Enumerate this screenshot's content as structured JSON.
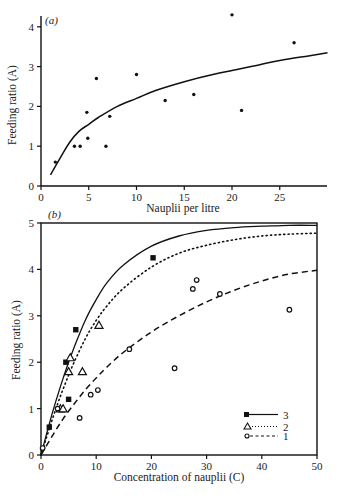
{
  "chart_data": [
    {
      "panel": "(a)",
      "type": "scatter",
      "title": "",
      "xlabel": "Nauplii per litre",
      "ylabel": "Feeding ratio (A)",
      "xlim": [
        0,
        30
      ],
      "ylim": [
        0,
        4
      ],
      "xticks": [
        0,
        5,
        10,
        15,
        20,
        25
      ],
      "yticks": [
        0,
        1,
        2,
        3,
        4
      ],
      "grid": false,
      "series": [
        {
          "name": "observations",
          "marker": "dot",
          "points": [
            [
              1.5,
              0.6
            ],
            [
              3.5,
              1.0
            ],
            [
              4.1,
              1.0
            ],
            [
              4.8,
              1.85
            ],
            [
              4.9,
              1.2
            ],
            [
              5.8,
              2.7
            ],
            [
              6.8,
              1.0
            ],
            [
              7.2,
              1.75
            ],
            [
              10.0,
              2.8
            ],
            [
              13.0,
              2.15
            ],
            [
              16.0,
              2.3
            ],
            [
              20.0,
              4.3
            ],
            [
              21.0,
              1.9
            ],
            [
              26.5,
              3.6
            ]
          ]
        },
        {
          "name": "fitted curve",
          "line": "solid",
          "points": [
            [
              1.0,
              0.28
            ],
            [
              2.0,
              0.7
            ],
            [
              3.0,
              1.1
            ],
            [
              4.0,
              1.38
            ],
            [
              5.0,
              1.55
            ],
            [
              6.0,
              1.72
            ],
            [
              8.0,
              2.0
            ],
            [
              10.0,
              2.2
            ],
            [
              12.0,
              2.4
            ],
            [
              15.0,
              2.62
            ],
            [
              18.0,
              2.8
            ],
            [
              20.0,
              2.9
            ],
            [
              22.0,
              3.0
            ],
            [
              25.0,
              3.15
            ],
            [
              28.0,
              3.27
            ],
            [
              30.0,
              3.35
            ]
          ]
        }
      ]
    },
    {
      "panel": "(b)",
      "type": "scatter",
      "title": "",
      "xlabel": "Concentration of nauplii (C)",
      "ylabel": "Feeding ratio (A)",
      "xlim": [
        0,
        50
      ],
      "ylim": [
        0,
        5
      ],
      "xticks": [
        0,
        10,
        20,
        30,
        40,
        50
      ],
      "yticks": [
        0,
        1,
        2,
        3,
        4,
        5
      ],
      "grid": false,
      "legend_position": "lower right",
      "series": [
        {
          "name": "3",
          "marker": "filled-square",
          "line": "solid",
          "points": [
            [
              1.5,
              0.6
            ],
            [
              4.5,
              2.0
            ],
            [
              5.0,
              1.2
            ],
            [
              6.3,
              2.7
            ],
            [
              20.3,
              4.25
            ]
          ],
          "curve": [
            [
              0,
              0
            ],
            [
              1,
              0.45
            ],
            [
              2,
              0.88
            ],
            [
              3,
              1.28
            ],
            [
              4,
              1.65
            ],
            [
              5,
              2.0
            ],
            [
              6,
              2.32
            ],
            [
              8,
              2.9
            ],
            [
              10,
              3.35
            ],
            [
              12,
              3.72
            ],
            [
              15,
              4.1
            ],
            [
              20,
              4.5
            ],
            [
              25,
              4.72
            ],
            [
              30,
              4.84
            ],
            [
              35,
              4.9
            ],
            [
              40,
              4.93
            ],
            [
              45,
              4.95
            ],
            [
              50,
              4.95
            ]
          ]
        },
        {
          "name": "2",
          "marker": "open-triangle",
          "line": "dotted",
          "points": [
            [
              3.5,
              1.0
            ],
            [
              4.0,
              1.0
            ],
            [
              5.0,
              1.8
            ],
            [
              5.3,
              2.1
            ],
            [
              7.5,
              1.8
            ],
            [
              10.5,
              2.8
            ]
          ],
          "curve": [
            [
              0,
              0
            ],
            [
              1,
              0.38
            ],
            [
              2,
              0.75
            ],
            [
              3,
              1.1
            ],
            [
              4,
              1.42
            ],
            [
              5,
              1.72
            ],
            [
              6,
              2.0
            ],
            [
              8,
              2.5
            ],
            [
              10,
              2.9
            ],
            [
              12,
              3.22
            ],
            [
              15,
              3.6
            ],
            [
              20,
              4.05
            ],
            [
              25,
              4.35
            ],
            [
              30,
              4.52
            ],
            [
              35,
              4.64
            ],
            [
              40,
              4.72
            ],
            [
              45,
              4.76
            ],
            [
              50,
              4.78
            ]
          ]
        },
        {
          "name": "1",
          "marker": "open-circle",
          "line": "dashed",
          "points": [
            [
              0.3,
              0.15
            ],
            [
              3.0,
              1.0
            ],
            [
              7.0,
              0.8
            ],
            [
              9.0,
              1.3
            ],
            [
              10.3,
              1.4
            ],
            [
              16.0,
              2.28
            ],
            [
              24.2,
              1.87
            ],
            [
              27.5,
              3.58
            ],
            [
              28.2,
              3.77
            ],
            [
              32.4,
              3.47
            ],
            [
              45.0,
              3.13
            ]
          ],
          "curve": [
            [
              0,
              0
            ],
            [
              2,
              0.4
            ],
            [
              4,
              0.78
            ],
            [
              6,
              1.1
            ],
            [
              8,
              1.4
            ],
            [
              10,
              1.66
            ],
            [
              12,
              1.9
            ],
            [
              15,
              2.22
            ],
            [
              20,
              2.65
            ],
            [
              25,
              3.0
            ],
            [
              30,
              3.3
            ],
            [
              35,
              3.55
            ],
            [
              40,
              3.75
            ],
            [
              45,
              3.9
            ],
            [
              50,
              3.98
            ]
          ]
        }
      ]
    }
  ],
  "panels": {
    "a": {
      "label": "(a)",
      "xlabel": "Nauplii per litre",
      "ylabel": "Feeding ratio (A)",
      "xtick_labels": [
        "0",
        "5",
        "10",
        "15",
        "20",
        "25"
      ],
      "ytick_labels": [
        "0",
        "1",
        "2",
        "3",
        "4"
      ]
    },
    "b": {
      "label": "(b)",
      "xlabel": "Concentration of nauplii (C)",
      "ylabel": "Feeding ratio (A)",
      "xtick_labels": [
        "0",
        "10",
        "20",
        "30",
        "40",
        "50"
      ],
      "ytick_labels": [
        "0",
        "1",
        "2",
        "3",
        "4",
        "5"
      ],
      "legend": [
        "3",
        "2",
        "1"
      ]
    }
  }
}
